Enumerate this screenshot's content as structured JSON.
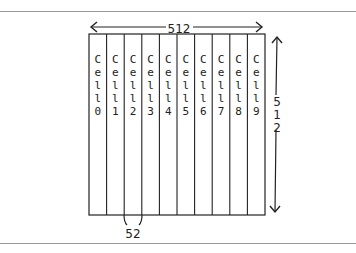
{
  "diagram": {
    "width_label": "512",
    "height_label": "512",
    "cell_width_label": "52",
    "cells": [
      {
        "label": "Cell0"
      },
      {
        "label": "Cell1"
      },
      {
        "label": "Cell2"
      },
      {
        "label": "Cell3"
      },
      {
        "label": "Cell4"
      },
      {
        "label": "Cell5"
      },
      {
        "label": "Cell6"
      },
      {
        "label": "Cell7"
      },
      {
        "label": "Cell8"
      },
      {
        "label": "Cell9"
      }
    ],
    "colors": {
      "stroke": "#222222",
      "rule": "#9a9a9a"
    }
  }
}
